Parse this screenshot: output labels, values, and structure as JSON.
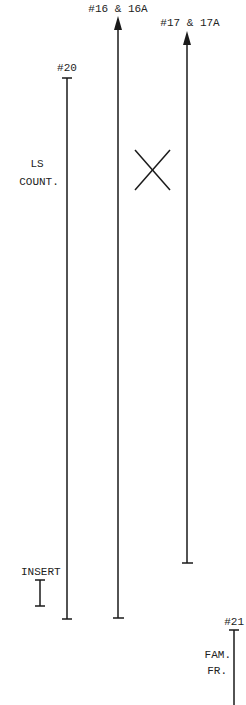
{
  "diagram": {
    "stroke_color": "#1a1a1a",
    "text_color": "#222222",
    "labels": {
      "line_16": "#16 & 16A",
      "line_17": "#17 & 17A",
      "line_20": "#20",
      "line_21": "#21",
      "ls_count_1": "LS",
      "ls_count_2": "COUNT.",
      "insert": "INSERT",
      "fam_fr_1": "FAM.",
      "fam_fr_2": "FR."
    },
    "lines": [
      {
        "id": "20",
        "x": 67,
        "y_top": 78,
        "y_bottom": 619,
        "top": "tick",
        "bottom": "tick"
      },
      {
        "id": "16",
        "x": 118,
        "y_top": 16,
        "y_bottom": 618,
        "top": "arrow",
        "bottom": "tick"
      },
      {
        "id": "17",
        "x": 187,
        "y_top": 31,
        "y_bottom": 563,
        "top": "arrow",
        "bottom": "tick"
      },
      {
        "id": "21",
        "x": 234,
        "y_top": 630,
        "y_bottom": 705,
        "top": "tick",
        "bottom": "none"
      },
      {
        "id": "insert",
        "x": 40,
        "y_top": 580,
        "y_bottom": 606,
        "top": "tick",
        "bottom": "tick"
      }
    ],
    "cross_mark": {
      "x1": 135,
      "y1": 150,
      "x2": 170,
      "y2": 190
    }
  }
}
